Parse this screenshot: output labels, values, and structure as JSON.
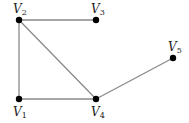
{
  "diagram": {
    "type": "undirected-graph",
    "nodes": [
      {
        "id": "V1",
        "label": "V",
        "sub": "1",
        "x": 19,
        "y": 99,
        "lx": 13,
        "ly": 116
      },
      {
        "id": "V2",
        "label": "V",
        "sub": "2",
        "x": 19,
        "y": 20,
        "lx": 13,
        "ly": 13
      },
      {
        "id": "V3",
        "label": "V",
        "sub": "3",
        "x": 96,
        "y": 20,
        "lx": 91,
        "ly": 13
      },
      {
        "id": "V4",
        "label": "V",
        "sub": "4",
        "x": 96,
        "y": 99,
        "lx": 91,
        "ly": 116
      },
      {
        "id": "V5",
        "label": "V",
        "sub": "5",
        "x": 173,
        "y": 58,
        "lx": 168,
        "ly": 51
      }
    ],
    "edges": [
      {
        "from": "V2",
        "to": "V3"
      },
      {
        "from": "V2",
        "to": "V1"
      },
      {
        "from": "V2",
        "to": "V4"
      },
      {
        "from": "V1",
        "to": "V4"
      },
      {
        "from": "V4",
        "to": "V5"
      }
    ],
    "colors": {
      "edge": "#8a8a8a",
      "node": "#000000",
      "label": "#222222"
    }
  }
}
